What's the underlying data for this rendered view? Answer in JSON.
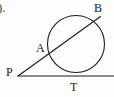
{
  "figure": {
    "name": "circle-with-tangent-and-secant",
    "background_color": "#fdfdfc",
    "stroke_color": "#1b1b1b",
    "label_color": "#1b1b1b",
    "corner_mark_color": "#4a4a4a",
    "width": 114,
    "height": 97
  },
  "labels": {
    "corner_mark": ").",
    "point_a": "A",
    "point_b": "B",
    "point_p": "P",
    "point_t": "T"
  },
  "geometry": {
    "circle": {
      "cx": 76,
      "cy": 44,
      "r": 28.5,
      "stroke_width": 1.1
    },
    "tangent_line": {
      "x1": 18,
      "y1": 76,
      "x2": 114,
      "y2": 76,
      "stroke_width": 1.1
    },
    "secant_line": {
      "x1": 18,
      "y1": 76,
      "x2": 100.5,
      "y2": 16.5,
      "stroke_width": 1.1
    },
    "points": {
      "p": {
        "x": 18,
        "y": 76
      },
      "t": {
        "x": 76,
        "y": 76
      },
      "a": {
        "x": 48.6,
        "y": 53.2
      },
      "b": {
        "x": 98.6,
        "y": 17.8
      }
    }
  }
}
